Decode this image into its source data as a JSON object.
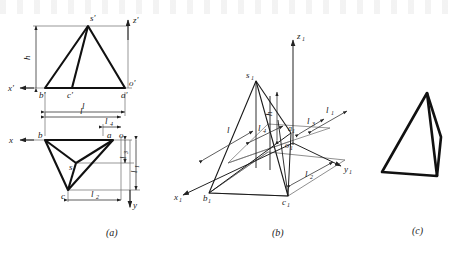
{
  "figure": {
    "captions": [
      {
        "key": "a",
        "text": "(a)",
        "x": 115,
        "y": 232
      },
      {
        "key": "b",
        "text": "(b)",
        "x": 281,
        "y": 232
      },
      {
        "key": "c",
        "text": "(c)",
        "x": 420,
        "y": 231
      }
    ],
    "colors": {
      "object_line": "#111111",
      "thin_line": "#555555",
      "dim_line": "#333333",
      "background": "#ffffff"
    }
  },
  "panel_a": {
    "name": "orthographic-projections",
    "front_view": {
      "name": "front-view",
      "vertices": [
        {
          "label": "s'",
          "x": 88,
          "y": 26,
          "label_x": 90,
          "label_y": 21
        },
        {
          "label": "b'",
          "x": 45,
          "y": 88,
          "label_x": 40,
          "label_y": 97
        },
        {
          "label": "c'",
          "x": 72,
          "y": 88,
          "label_x": 68,
          "label_y": 97
        },
        {
          "label": "a'",
          "x": 125,
          "y": 88,
          "label_x": 122,
          "label_y": 97
        }
      ],
      "axis_labels": [
        {
          "label": "z'",
          "x": 136,
          "y": 22
        },
        {
          "label": "x'",
          "x": 12,
          "y": 88
        },
        {
          "label": "o'",
          "x": 130,
          "y": 86
        }
      ],
      "dimensions": [
        {
          "label": "h",
          "kind": "vertical",
          "x": 33,
          "y": 57
        },
        {
          "label": "l",
          "kind": "horizontal",
          "x": 84,
          "y": 108
        }
      ]
    },
    "top_view": {
      "name": "top-view",
      "vertices": [
        {
          "label": "b",
          "x": 45,
          "y": 140,
          "label_x": 39,
          "label_y": 136
        },
        {
          "label": "a",
          "x": 113,
          "y": 140,
          "label_x": 108,
          "label_y": 136
        },
        {
          "label": "c",
          "x": 68,
          "y": 190,
          "label_x": 62,
          "label_y": 198
        },
        {
          "label": "s",
          "x": 76,
          "y": 163,
          "label_x": 70,
          "label_y": 168
        }
      ],
      "axis_labels": [
        {
          "label": "x",
          "x": 12,
          "y": 137
        },
        {
          "label": "y",
          "x": 136,
          "y": 203
        },
        {
          "label": "o",
          "x": 121,
          "y": 136
        }
      ],
      "dimensions": [
        {
          "label": "l",
          "kind": "horizontal",
          "x": 82,
          "y": 117
        },
        {
          "label": "l",
          "sub": "4",
          "kind": "horizontal",
          "x": 103,
          "y": 127
        },
        {
          "label": "l",
          "sub": "2",
          "kind": "horizontal",
          "x": 96,
          "y": 196
        },
        {
          "label": "l",
          "sub": "3",
          "kind": "vertical",
          "x": 125,
          "y": 151
        },
        {
          "label": "l",
          "sub": "1",
          "kind": "vertical",
          "x": 134,
          "y": 163
        }
      ]
    }
  },
  "panel_b": {
    "name": "axonometric-construction",
    "axes": [
      {
        "label": "z",
        "sub": "1",
        "x": 299,
        "y": 36
      },
      {
        "label": "y",
        "sub": "1",
        "x": 347,
        "y": 169
      },
      {
        "label": "x",
        "sub": "1",
        "x": 178,
        "y": 198
      }
    ],
    "vertices": [
      {
        "label": "s",
        "sub": "1",
        "x": 256,
        "y": 81,
        "label_x": 248,
        "label_y": 78
      },
      {
        "label": "b",
        "sub": "1",
        "x": 209,
        "y": 193,
        "label_x": 204,
        "label_y": 200
      },
      {
        "label": "c",
        "sub": "1",
        "x": 288,
        "y": 196,
        "label_x": 283,
        "label_y": 204
      },
      {
        "label": "a",
        "sub": "1",
        "x": 291,
        "y": 133,
        "label_x": 289,
        "label_y": 130
      },
      {
        "label": "o",
        "sub": "1",
        "x": 291,
        "y": 141,
        "label_x": 288,
        "label_y": 146
      }
    ],
    "dimensions": [
      {
        "label": "l",
        "x": 233,
        "y": 125
      },
      {
        "label": "l",
        "sub": "4",
        "x": 261,
        "y": 129
      },
      {
        "label": "l",
        "sub": "3",
        "x": 309,
        "y": 122
      },
      {
        "label": "l",
        "sub": "1",
        "x": 328,
        "y": 116
      },
      {
        "label": "l",
        "sub": "2",
        "x": 310,
        "y": 172
      },
      {
        "label": "h",
        "x": 277,
        "y": 113
      }
    ]
  },
  "panel_c": {
    "name": "finished-pyramid",
    "vertices": [
      {
        "label": "apex",
        "x": 427,
        "y": 93
      },
      {
        "label": "front-left",
        "x": 382,
        "y": 172
      },
      {
        "label": "front-right",
        "x": 437,
        "y": 176
      },
      {
        "label": "right",
        "x": 441,
        "y": 137
      }
    ]
  }
}
